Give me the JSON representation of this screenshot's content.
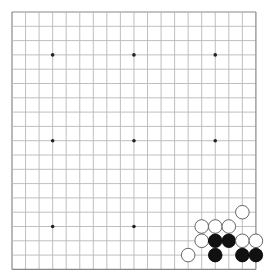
{
  "board": {
    "size": 19,
    "origin_x": 12,
    "origin_y": 12,
    "spacing_x": 13.55,
    "spacing_y": 14.3,
    "line_color": "#b8b8b8",
    "border_color": "#888888",
    "background": "#ffffff",
    "star_points": [
      [
        3,
        3
      ],
      [
        9,
        3
      ],
      [
        15,
        3
      ],
      [
        3,
        9
      ],
      [
        9,
        9
      ],
      [
        15,
        9
      ],
      [
        3,
        15
      ],
      [
        9,
        15
      ],
      [
        15,
        15
      ]
    ],
    "stone_radius": 6.8
  },
  "stones": [
    {
      "color": "white",
      "col": 17,
      "row": 14
    },
    {
      "color": "white",
      "col": 14,
      "row": 15
    },
    {
      "color": "white",
      "col": 15,
      "row": 15
    },
    {
      "color": "white",
      "col": 16,
      "row": 15
    },
    {
      "color": "white",
      "col": 14,
      "row": 16
    },
    {
      "color": "black",
      "col": 15,
      "row": 16
    },
    {
      "color": "black",
      "col": 16,
      "row": 16
    },
    {
      "color": "white",
      "col": 17,
      "row": 16
    },
    {
      "color": "white",
      "col": 18,
      "row": 16
    },
    {
      "color": "white",
      "col": 13,
      "row": 17
    },
    {
      "color": "black",
      "col": 15,
      "row": 17
    },
    {
      "color": "black",
      "col": 17,
      "row": 17
    },
    {
      "color": "black",
      "col": 18,
      "row": 17
    }
  ]
}
